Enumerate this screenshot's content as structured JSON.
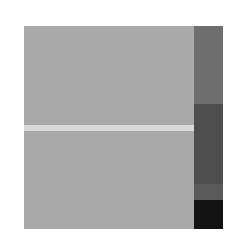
{
  "colors": {
    "background": "#ffffff",
    "main_square": "#a9a9a9",
    "stripe": "#d9d9d9"
  },
  "side_bar": {
    "segments": [
      {
        "top": 0,
        "height": 78,
        "color": "#6e6e6e"
      },
      {
        "top": 78,
        "height": 80,
        "color": "#4e4e4e"
      },
      {
        "top": 158,
        "height": 16,
        "color": "#5a5a5a"
      },
      {
        "top": 174,
        "height": 29,
        "color": "#121212"
      }
    ]
  }
}
